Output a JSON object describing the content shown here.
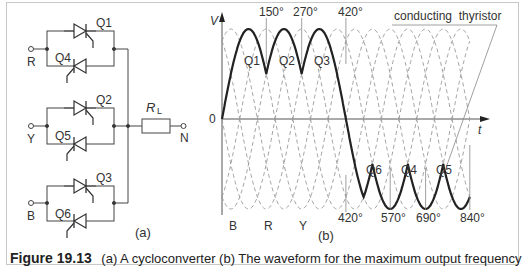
{
  "caption": {
    "figure_number": "Figure 19.13",
    "text": "(a) A cycloconverter (b) The waveform for the maximum output frequency"
  },
  "circuit": {
    "sublabel": "(a)",
    "inputs": [
      "R",
      "Y",
      "B"
    ],
    "thyristors": [
      "Q1",
      "Q4",
      "Q2",
      "Q5",
      "Q3",
      "Q6"
    ],
    "load_label": "R",
    "load_subscript": "L",
    "output": "N"
  },
  "waveform": {
    "sublabel": "(b)",
    "y_axis_label": "V",
    "x_axis_label": "t",
    "origin_label": "0",
    "top_angles": [
      "150°",
      "270°",
      "420°"
    ],
    "bottom_angles": [
      "420°",
      "570°",
      "690°",
      "840°"
    ],
    "positive_segments": [
      "Q1",
      "Q2",
      "Q3"
    ],
    "negative_segments": [
      "Q6",
      "Q4",
      "Q5"
    ],
    "phase_labels": [
      "B",
      "R",
      "Y"
    ],
    "annotation": "conducting  thyristor"
  },
  "chart_data": {
    "type": "line",
    "xlabel": "t (electrical degrees)",
    "ylabel": "V",
    "series": [
      {
        "name": "R phase",
        "phase_deg": 0
      },
      {
        "name": "Y phase",
        "phase_deg": -120
      },
      {
        "name": "B phase",
        "phase_deg": -240
      },
      {
        "name": "Output (bold)",
        "positive_half": "0°–420° via Q1,Q2,Q3",
        "negative_half": "420°–840° via Q6,Q4,Q5"
      }
    ],
    "markers_deg": [
      150,
      270,
      420,
      570,
      690,
      840
    ],
    "xlim": [
      0,
      900
    ]
  }
}
